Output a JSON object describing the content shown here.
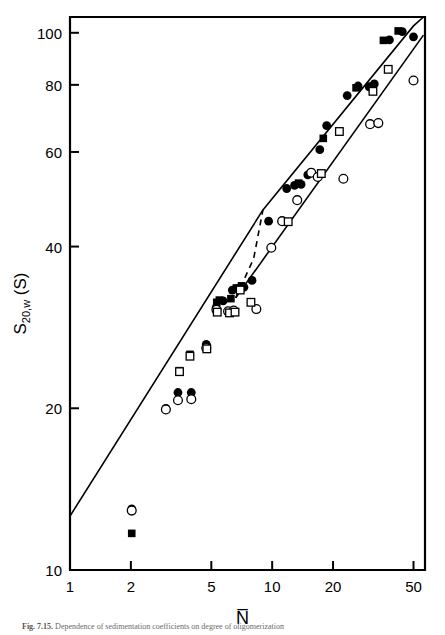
{
  "figure": {
    "caption_label": "Fig. 7.15.",
    "caption_text": "Dependence of sedimentation coefficients on degree of oligomerization"
  },
  "chart_data": {
    "type": "scatter",
    "title": "",
    "xlabel": "N̅",
    "ylabel": "S20,w (S)",
    "xscale": "log",
    "yscale": "log",
    "xlim": [
      1,
      57
    ],
    "ylim": [
      10,
      107
    ],
    "xticks": [
      1,
      2,
      5,
      10,
      20,
      50
    ],
    "xticklabels": [
      "1",
      "2",
      "5",
      "10",
      "20",
      "50"
    ],
    "yticks": [
      10,
      20,
      40,
      60,
      80,
      100
    ],
    "yticklabels": [
      "10",
      "20",
      "40",
      "60",
      "80",
      "100"
    ],
    "grid": false,
    "legend": "none",
    "series": [
      {
        "name": "filled-circle",
        "marker": "filled-circle",
        "points": [
          [
            2.02,
            13.0
          ],
          [
            2.98,
            20.0
          ],
          [
            3.42,
            21.4
          ],
          [
            3.98,
            21.4
          ],
          [
            4.72,
            26.3
          ],
          [
            5.28,
            30.8
          ],
          [
            5.72,
            31.7
          ],
          [
            6.35,
            33.2
          ],
          [
            6.75,
            33.4
          ],
          [
            7.25,
            33.6
          ],
          [
            7.95,
            34.6
          ],
          [
            9.6,
            44.6
          ],
          [
            11.8,
            51.3
          ],
          [
            12.9,
            52.0
          ],
          [
            13.9,
            52.2
          ],
          [
            15.0,
            54.4
          ],
          [
            17.2,
            60.6
          ],
          [
            18.6,
            67.2
          ],
          [
            23.5,
            76.4
          ],
          [
            26.6,
            79.6
          ],
          [
            30.2,
            79.3
          ],
          [
            32.0,
            80.3
          ],
          [
            38.0,
            97.0
          ],
          [
            44.0,
            100.5
          ],
          [
            50.0,
            98.3
          ]
        ]
      },
      {
        "name": "filled-square",
        "marker": "filled-square",
        "points": [
          [
            2.02,
            11.7
          ],
          [
            3.48,
            23.5
          ],
          [
            3.92,
            25.2
          ],
          [
            4.75,
            26.0
          ],
          [
            5.32,
            31.5
          ],
          [
            5.48,
            31.8
          ],
          [
            6.25,
            32.0
          ],
          [
            6.65,
            33.5
          ],
          [
            7.05,
            33.8
          ],
          [
            13.5,
            52.5
          ],
          [
            17.9,
            63.6
          ],
          [
            26.0,
            79.0
          ],
          [
            30.5,
            79.5
          ],
          [
            35.5,
            96.8
          ],
          [
            42.0,
            100.8
          ]
        ]
      },
      {
        "name": "open-circle",
        "marker": "open-circle",
        "points": [
          [
            2.02,
            12.9
          ],
          [
            2.98,
            19.9
          ],
          [
            3.42,
            20.7
          ],
          [
            3.98,
            20.8
          ],
          [
            4.72,
            25.9
          ],
          [
            5.3,
            30.5
          ],
          [
            6.05,
            30.3
          ],
          [
            6.45,
            30.4
          ],
          [
            8.35,
            30.6
          ],
          [
            9.9,
            39.8
          ],
          [
            11.2,
            44.6
          ],
          [
            13.3,
            48.8
          ],
          [
            15.6,
            54.9
          ],
          [
            16.8,
            53.9
          ],
          [
            22.5,
            53.5
          ],
          [
            30.5,
            67.6
          ],
          [
            33.5,
            67.9
          ],
          [
            50.0,
            81.5
          ]
        ]
      },
      {
        "name": "open-square",
        "marker": "open-square",
        "points": [
          [
            3.48,
            23.4
          ],
          [
            3.92,
            25.0
          ],
          [
            4.75,
            25.8
          ],
          [
            5.35,
            30.2
          ],
          [
            6.15,
            30.1
          ],
          [
            6.55,
            30.2
          ],
          [
            7.85,
            31.5
          ],
          [
            6.95,
            33.2
          ],
          [
            12.0,
            44.5
          ],
          [
            17.5,
            54.7
          ],
          [
            21.5,
            65.5
          ],
          [
            31.5,
            77.8
          ],
          [
            37.5,
            85.5
          ]
        ]
      }
    ],
    "lines": [
      {
        "name": "upper-trend-line",
        "style": "solid",
        "points": [
          [
            1.0,
            12.6
          ],
          [
            9.0,
            46.8
          ],
          [
            50.0,
            103.0
          ],
          [
            56.0,
            107.0
          ]
        ]
      },
      {
        "name": "lower-trend-line",
        "style": "solid",
        "points": [
          [
            6.6,
            32.1
          ],
          [
            56.0,
            99.0
          ]
        ]
      },
      {
        "name": "transition-dashed-segment",
        "style": "dashed",
        "points": [
          [
            6.6,
            32.1
          ],
          [
            8.1,
            38.0
          ],
          [
            9.0,
            46.8
          ]
        ]
      }
    ]
  }
}
